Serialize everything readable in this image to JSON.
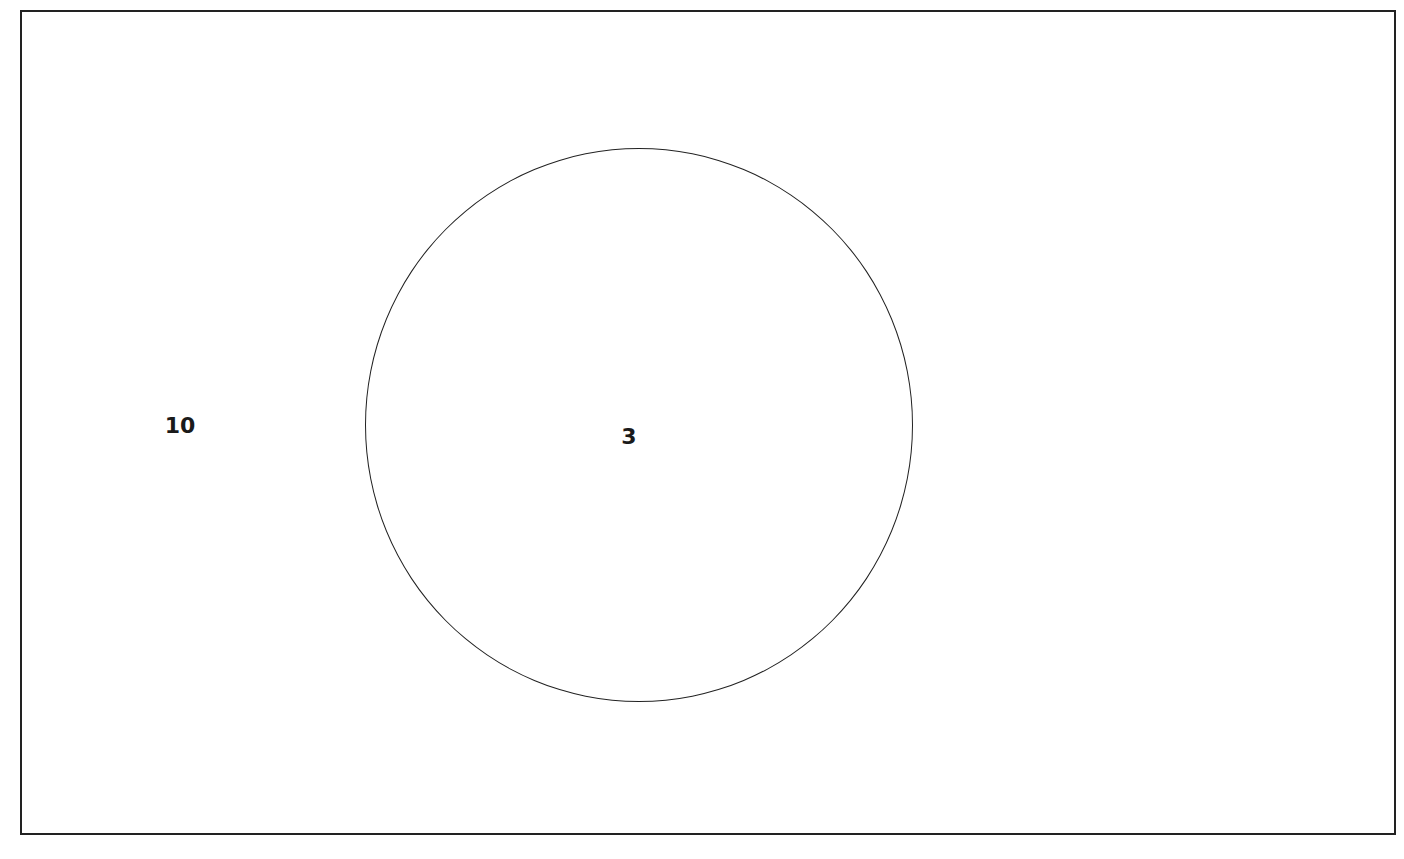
{
  "diagram": {
    "type": "venn",
    "universal_set": {
      "outside_count": "10"
    },
    "sets": [
      {
        "name": "A",
        "count": "3"
      }
    ],
    "colors": {
      "stroke": "#222222",
      "background": "#ffffff"
    }
  }
}
